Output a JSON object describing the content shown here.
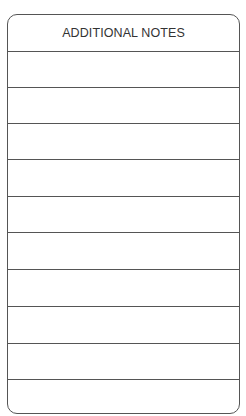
{
  "form": {
    "title": "ADDITIONAL NOTES",
    "line_count": 10,
    "lines": [
      "",
      "",
      "",
      "",
      "",
      "",
      "",
      "",
      "",
      ""
    ]
  }
}
